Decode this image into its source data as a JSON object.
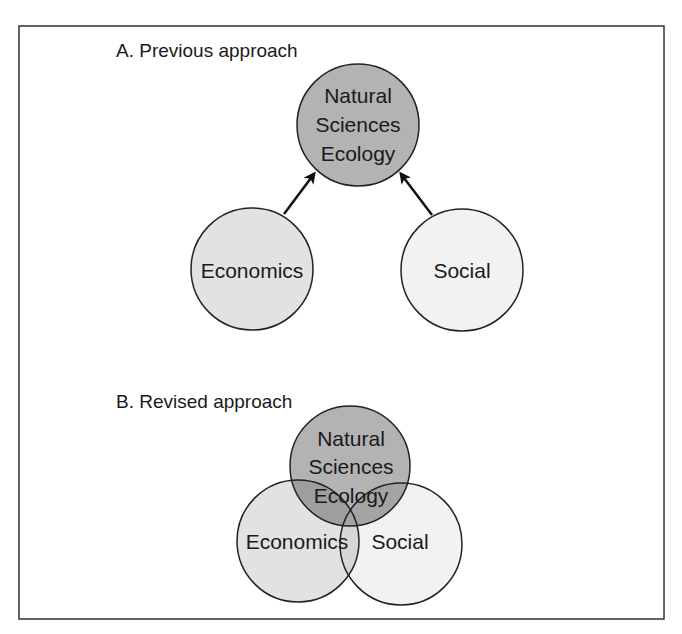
{
  "panels": [
    {
      "title": "A. Previous approach",
      "nodes": {
        "natural": {
          "lines": [
            "Natural",
            "Sciences",
            "Ecology"
          ]
        },
        "economics": {
          "label": "Economics"
        },
        "social": {
          "label": "Social"
        }
      },
      "relations": [
        {
          "from": "Economics",
          "to": "Natural Sciences Ecology",
          "type": "arrow"
        },
        {
          "from": "Social",
          "to": "Natural Sciences Ecology",
          "type": "arrow"
        }
      ]
    },
    {
      "title": "B. Revised approach",
      "nodes": {
        "natural": {
          "lines": [
            "Natural",
            "Sciences",
            "Ecology"
          ]
        },
        "economics": {
          "label": "Economics"
        },
        "social": {
          "label": "Social"
        }
      },
      "relations": [
        {
          "type": "overlap",
          "sets": [
            "Natural Sciences Ecology",
            "Economics",
            "Social"
          ]
        }
      ]
    }
  ],
  "colors": {
    "natural_fill": "#b3b3b3",
    "economics_fill": "#e2e2e2",
    "social_fill": "#f2f2f2",
    "stroke": "#222222",
    "frame": "#333333"
  }
}
